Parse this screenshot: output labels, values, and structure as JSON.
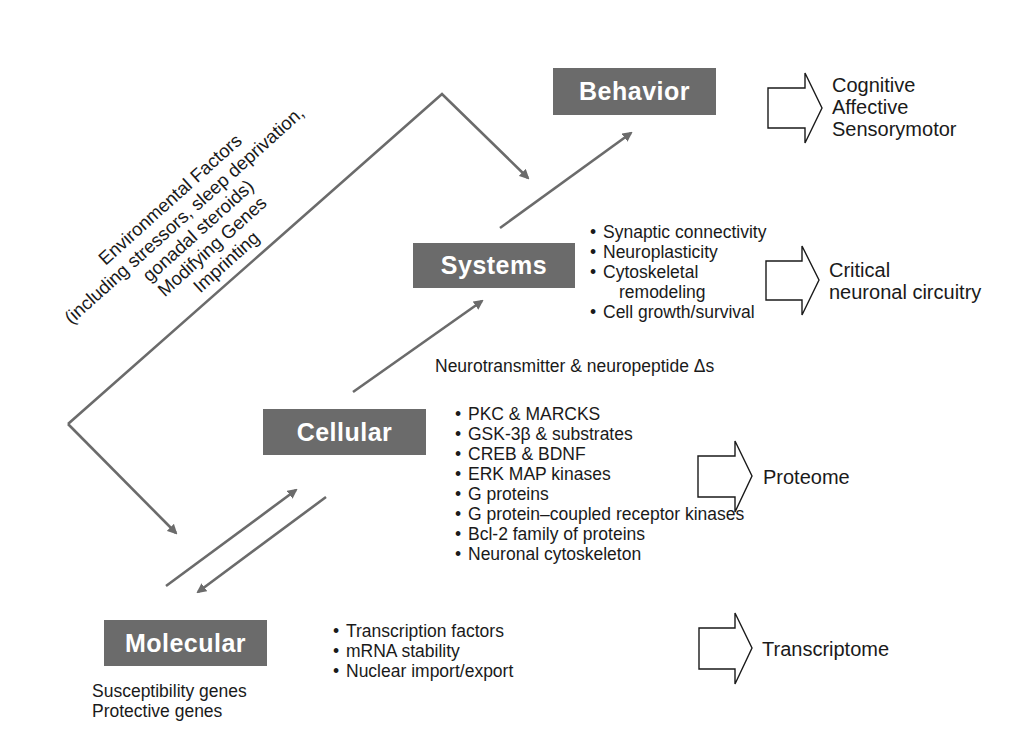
{
  "diagram": {
    "levels": {
      "behavior": {
        "label": "Behavior"
      },
      "systems": {
        "label": "Systems"
      },
      "cellular": {
        "label": "Cellular"
      },
      "molecular": {
        "label": "Molecular"
      }
    },
    "environmental_factors": {
      "lines": [
        "Environmental Factors",
        "(including stressors, sleep deprivation,",
        "gonadal steroids)",
        "Modifying Genes",
        "Imprinting"
      ]
    },
    "systems_items": [
      "Synaptic connectivity",
      "Neuroplasticity",
      "Cytoskeletal",
      "remodeling",
      "Cell growth/survival"
    ],
    "neurotransmitter_note": "Neurotransmitter & neuropeptide Δs",
    "cellular_items": [
      "PKC & MARCKS",
      "GSK-3β & substrates",
      "CREB & BDNF",
      "ERK MAP kinases",
      "G proteins",
      "G protein–coupled receptor kinases",
      "Bcl-2 family of proteins",
      "Neuronal cytoskeleton"
    ],
    "molecular_items": [
      "Transcription factors",
      "mRNA stability",
      "Nuclear import/export"
    ],
    "molecular_genes": [
      "Susceptibility genes",
      "Protective genes"
    ],
    "outcomes": {
      "behavior": [
        "Cognitive",
        "Affective",
        "Sensorymotor"
      ],
      "systems": [
        "Critical",
        "neuronal circuitry"
      ],
      "cellular": [
        "Proteome"
      ],
      "molecular": [
        "Transcriptome"
      ]
    },
    "colors": {
      "box_fill": "#6b6b6b",
      "box_text": "#ffffff",
      "arrow": "#6b6b6b",
      "outline": "#1a1a1a"
    }
  }
}
